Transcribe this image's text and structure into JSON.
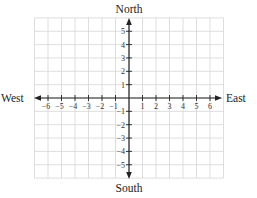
{
  "diagram": {
    "type": "coordinate-grid",
    "labels": {
      "north": "North",
      "south": "South",
      "east": "East",
      "west": "West"
    },
    "x_ticks": [
      "−6",
      "−5",
      "−4",
      "−3",
      "−2",
      "−1",
      "1",
      "2",
      "3",
      "4",
      "5",
      "6"
    ],
    "x_tick_values": [
      -6,
      -5,
      -4,
      -3,
      -2,
      -1,
      1,
      2,
      3,
      4,
      5,
      6
    ],
    "y_ticks": [
      "5",
      "4",
      "3",
      "2",
      "1",
      "−1",
      "−2",
      "−3",
      "−4",
      "−5"
    ],
    "y_tick_values": [
      5,
      4,
      3,
      2,
      1,
      -1,
      -2,
      -3,
      -4,
      -5
    ],
    "grid": {
      "x_range": [
        -7,
        7
      ],
      "y_range": [
        -6,
        6
      ]
    },
    "colors": {
      "grid_line": "#d6d6d6",
      "axis": "#222222",
      "text": "#222222"
    }
  }
}
